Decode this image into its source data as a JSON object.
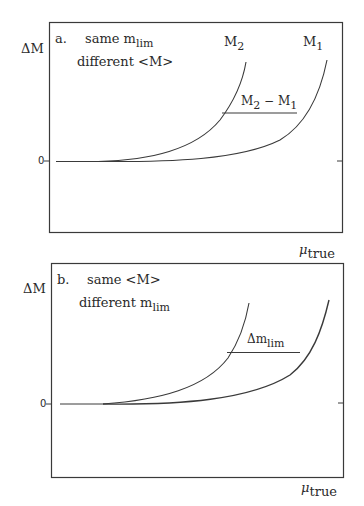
{
  "figure": {
    "panels": [
      {
        "id": "a",
        "label": "a.",
        "line1_prefix": "same m",
        "line1_sub": "lim",
        "line2": "different <M>",
        "y_axis_label": "ΔM",
        "zero_label": "0",
        "x_axis_label_main": "μ",
        "x_axis_label_sub": "true",
        "curves": [
          {
            "name": "M",
            "sub": "2"
          },
          {
            "name": "M",
            "sub": "1"
          }
        ],
        "difference_label": {
          "a": "M",
          "a_sub": "2",
          "op": " − ",
          "b": "M",
          "b_sub": "1"
        }
      },
      {
        "id": "b",
        "label": "b.",
        "line1": "same <M>",
        "line2_prefix": "different m",
        "line2_sub": "lim",
        "y_axis_label": "ΔM",
        "zero_label": "0",
        "x_axis_label_main": "μ",
        "x_axis_label_sub": "true",
        "difference_label": {
          "prefix": "Δm",
          "sub": "lim"
        }
      }
    ]
  },
  "colors": {
    "line": "#3a3a3a",
    "background": "#ffffff"
  }
}
